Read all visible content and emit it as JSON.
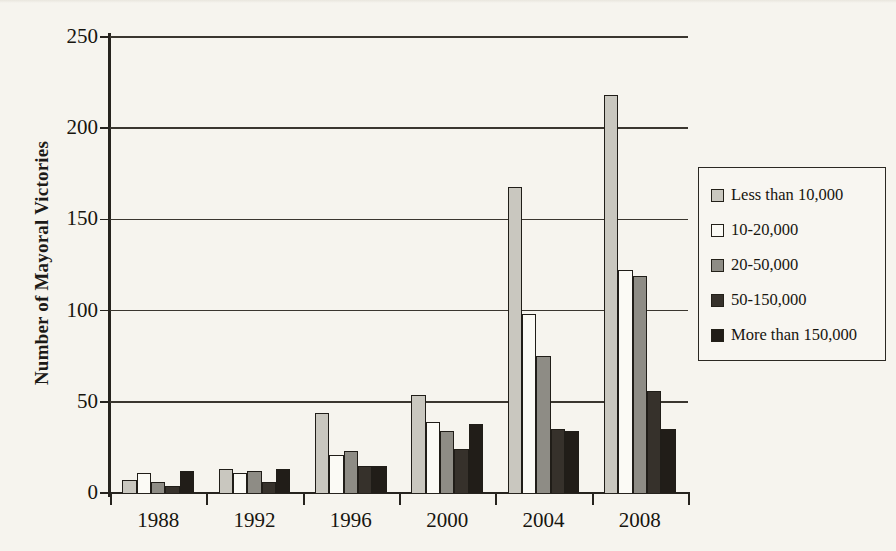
{
  "chart_data": {
    "type": "bar",
    "title": "",
    "xlabel": "",
    "ylabel": "Number of Mayoral Victories",
    "categories": [
      "1988",
      "1992",
      "1996",
      "2000",
      "2004",
      "2008"
    ],
    "ylim": [
      0,
      250
    ],
    "yticks": [
      0,
      50,
      100,
      150,
      200,
      250
    ],
    "grid": true,
    "legend_position": "right",
    "series": [
      {
        "name": "Less than 10,000",
        "color": "#c9c7bf",
        "values": [
          7,
          13,
          44,
          54,
          168,
          218
        ]
      },
      {
        "name": "10-20,000",
        "color": "#fbfaf5",
        "values": [
          11,
          11,
          21,
          39,
          98,
          122
        ]
      },
      {
        "name": "20-50,000",
        "color": "#8e8c85",
        "values": [
          6,
          12,
          23,
          34,
          75,
          119
        ]
      },
      {
        "name": "50-150,000",
        "color": "#36312b",
        "values": [
          4,
          6,
          15,
          24,
          35,
          56
        ]
      },
      {
        "name": "More than 150,000",
        "color": "#211d18",
        "values": [
          12,
          13,
          15,
          38,
          34,
          35
        ]
      }
    ]
  },
  "legend": {
    "items": [
      {
        "label": "Less than 10,000"
      },
      {
        "label": "10-20,000"
      },
      {
        "label": "20-50,000"
      },
      {
        "label": "50-150,000"
      },
      {
        "label": "More than 150,000"
      }
    ]
  },
  "axes": {
    "y_title": "Number of Mayoral Victories",
    "y_tick_labels": [
      "250",
      "200",
      "150",
      "100",
      "50",
      "0"
    ],
    "x_tick_labels": [
      "1988",
      "1992",
      "1996",
      "2000",
      "2004",
      "2008"
    ]
  }
}
